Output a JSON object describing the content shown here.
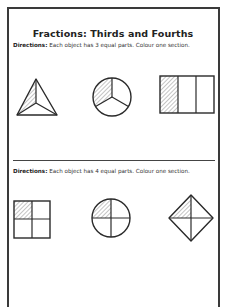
{
  "worksheet": {
    "title": "Fractions: Thirds and Fourths",
    "sections": [
      {
        "directions_label": "Directions:",
        "directions_text": " Each object has 3 equal parts. Colour one section.",
        "shapes": [
          {
            "name": "triangle",
            "parts": 3,
            "shaded_parts": 1
          },
          {
            "name": "circle",
            "parts": 3,
            "shaded_parts": 1
          },
          {
            "name": "rectangle",
            "parts": 3,
            "shaded_parts": 1
          }
        ]
      },
      {
        "directions_label": "Directions:",
        "directions_text": " Each object has 4 equal parts. Colour one section.",
        "shapes": [
          {
            "name": "square",
            "parts": 4,
            "shaded_parts": 1
          },
          {
            "name": "circle",
            "parts": 4,
            "shaded_parts": 1
          },
          {
            "name": "diamond",
            "parts": 4,
            "shaded_parts": 1
          }
        ]
      }
    ]
  },
  "colors": {
    "stroke": "#2a2a2a",
    "hatch": "#8a8a8a",
    "frame": "#3a3a3a",
    "background": "#ffffff"
  }
}
